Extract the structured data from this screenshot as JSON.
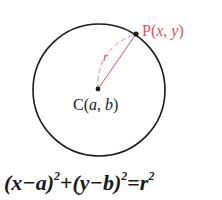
{
  "diagram": {
    "center_label": {
      "prefix": "C(",
      "a": "a",
      "sep": ", ",
      "b": "b",
      "suffix": ")"
    },
    "point_label": {
      "prefix": "P(",
      "x": "x",
      "sep": ", ",
      "y": "y",
      "suffix": ")"
    },
    "radius_label": "r",
    "colors": {
      "circle": "#1a1a1a",
      "accent": "#e0505a",
      "text": "#1a1a1a"
    },
    "geometry": {
      "center": [
        99,
        90
      ],
      "radius": 66,
      "point": [
        136,
        34
      ]
    }
  },
  "equation": {
    "part1": "(x−a)",
    "exp1": "2",
    "plus": "+",
    "part2": "(y−b)",
    "exp2": "2",
    "equals": "=",
    "rhs": "r",
    "exp3": "2"
  }
}
